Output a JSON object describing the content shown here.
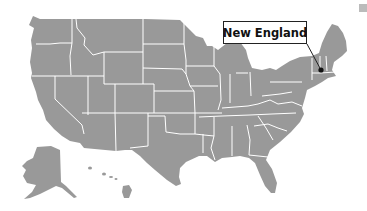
{
  "map": {
    "title": "United States map",
    "region_fill": "#999999",
    "border_color": "#ffffff",
    "background": "#ffffff"
  },
  "callout": {
    "label": "New England",
    "marker_color": "#111111",
    "box_border": "#222222"
  },
  "legend": {
    "swatch_color": "#bbbbbb",
    "labels": [
      "",
      ""
    ]
  }
}
